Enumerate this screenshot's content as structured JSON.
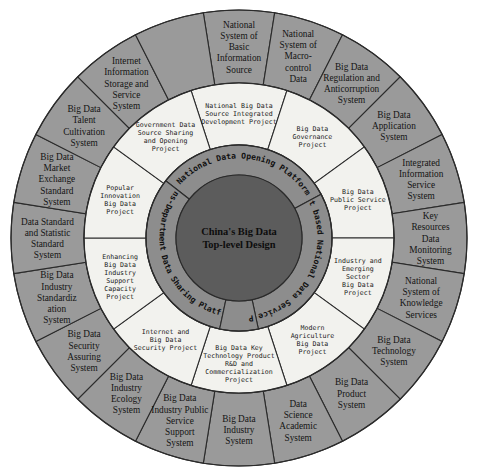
{
  "colors": {
    "background": "#ffffff",
    "outer_ring": "#9a9a9a",
    "middle_ring": "#f2f2ee",
    "inner_ring": "#8d8d8d",
    "hub": "#5c5c5c",
    "stroke": "#2b2b2b",
    "text": "#141414"
  },
  "hub": {
    "line1": "China's Big Data",
    "line2": "Top-level Design"
  },
  "inner_ring": {
    "name": "platforms",
    "count": 4,
    "items": [
      {
        "label": "National Data Opening Platform"
      },
      {
        "label": "Internet based National Data Service Platform"
      },
      {
        "label": "Trans-Department Data Sharing Platform"
      },
      {
        "label": "Four-Major Data Platforms"
      }
    ]
  },
  "middle_ring": {
    "name": "projects",
    "count": 10,
    "items": [
      {
        "lines": [
          "National Big Data",
          "Source Integrated",
          "Development Project"
        ]
      },
      {
        "lines": [
          "Big Data",
          "Governance",
          "Project"
        ]
      },
      {
        "lines": [
          "Big Data",
          "Public Service",
          "Project"
        ]
      },
      {
        "lines": [
          "Industry and",
          "Emerging",
          "Sector",
          "Big Data",
          "Project"
        ]
      },
      {
        "lines": [
          "Modern",
          "Agriculture",
          "Big Data",
          "Project"
        ]
      },
      {
        "lines": [
          "Big Data Key",
          "Technology Product",
          "R&D and",
          "Commercialization",
          "Project"
        ]
      },
      {
        "lines": [
          "Internet and",
          "Big Data",
          "Security Project"
        ]
      },
      {
        "lines": [
          "Enhancing",
          "Big Data",
          "Industry",
          "Support",
          "Capacity",
          "Project"
        ]
      },
      {
        "lines": [
          "Popular",
          "Innovation",
          "Big Data",
          "Project"
        ]
      },
      {
        "lines": [
          "Government Data",
          "Source Sharing",
          "and Opening",
          "Project"
        ]
      }
    ]
  },
  "outer_ring": {
    "name": "systems",
    "count": 20,
    "items": [
      {
        "lines": [
          "National",
          "System of",
          "Basic",
          "Information",
          "Source"
        ]
      },
      {
        "lines": [
          "National",
          "System of",
          "Macro-",
          "control",
          "Data"
        ]
      },
      {
        "lines": [
          "Big Data",
          "Regulation and",
          "Anticorruption",
          "System"
        ]
      },
      {
        "lines": [
          "Big Data",
          "Application",
          "System"
        ]
      },
      {
        "lines": [
          "Integrated",
          "Information",
          "Service",
          "System"
        ]
      },
      {
        "lines": [
          "Key",
          "Resources",
          "Data",
          "Monitoring",
          "System"
        ]
      },
      {
        "lines": [
          "National",
          "System of",
          "Knowledge",
          "Services"
        ]
      },
      {
        "lines": [
          "Big Data",
          "Technology",
          "System"
        ]
      },
      {
        "lines": [
          "Big Data",
          "Product",
          "System"
        ]
      },
      {
        "lines": [
          "Data",
          "Science",
          "Academic",
          "System"
        ]
      },
      {
        "lines": [
          "Big Data",
          "Industry",
          "System"
        ]
      },
      {
        "lines": [
          "Big Data",
          "Industry Public",
          "Service",
          "Support",
          "System"
        ]
      },
      {
        "lines": [
          "Big Data",
          "Industry",
          "Ecology",
          "System"
        ]
      },
      {
        "lines": [
          "Big Data",
          "Security",
          "Assuring",
          "System"
        ]
      },
      {
        "lines": [
          "Big Data",
          "Industry",
          "Standardiz",
          "ation",
          "System"
        ]
      },
      {
        "lines": [
          "Data Standard",
          "and Statistic",
          "Standard",
          "System"
        ]
      },
      {
        "lines": [
          "Big Data",
          "Market",
          "Exchange",
          "Standard",
          "System"
        ]
      },
      {
        "lines": [
          "Big Data",
          "Talent",
          "Cultivation",
          "System"
        ]
      },
      {
        "lines": [
          "Internet",
          "Information",
          "Storage and",
          "Service",
          "System"
        ]
      }
    ]
  },
  "geometry": {
    "center_x": 239,
    "center_y": 238,
    "r_hub": 63,
    "r_inner_outer": 93,
    "r_mid_outer": 155,
    "r_outer_outer": 228
  }
}
